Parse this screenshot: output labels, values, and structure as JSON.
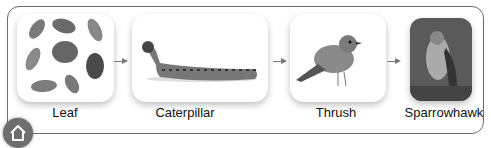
{
  "diagram": {
    "type": "food-chain",
    "nodes": [
      {
        "id": "leaf",
        "label": "Leaf",
        "icon": "leaves-image"
      },
      {
        "id": "caterpillar",
        "label": "Caterpillar",
        "icon": "caterpillar-image"
      },
      {
        "id": "thrush",
        "label": "Thrush",
        "icon": "thrush-image"
      },
      {
        "id": "sparrowhawk",
        "label": "Sparrowhawk",
        "icon": "sparrowhawk-image"
      }
    ],
    "edges": [
      {
        "from": "leaf",
        "to": "caterpillar"
      },
      {
        "from": "caterpillar",
        "to": "thrush"
      },
      {
        "from": "thrush",
        "to": "sparrowhawk"
      }
    ]
  },
  "home_button": {
    "icon": "home-icon"
  }
}
